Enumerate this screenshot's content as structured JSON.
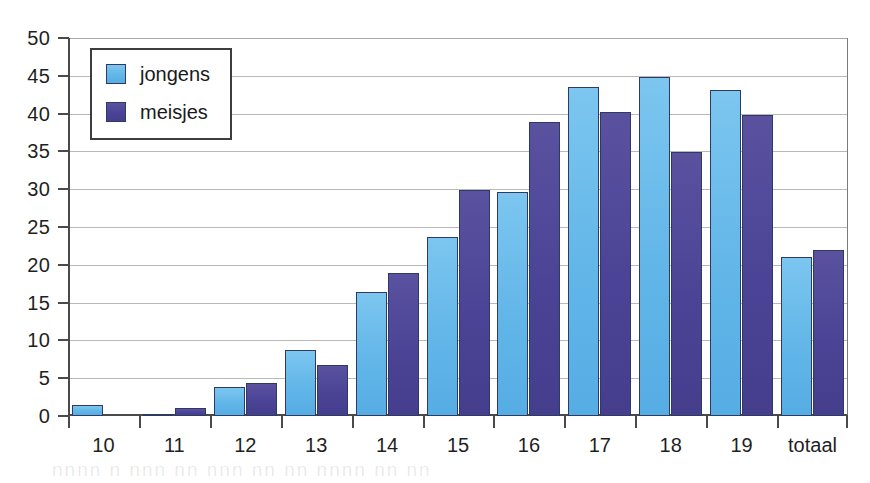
{
  "chart_data": {
    "type": "bar",
    "title": "",
    "subtitle": "",
    "xlabel": "",
    "ylabel": "",
    "categories": [
      "10",
      "11",
      "12",
      "13",
      "14",
      "15",
      "16",
      "17",
      "18",
      "19",
      "totaal"
    ],
    "series": [
      {
        "name": "jongens",
        "color": "#62b6e8",
        "values": [
          1.5,
          0.2,
          3.8,
          8.7,
          16.4,
          23.7,
          29.6,
          43.5,
          44.8,
          43.1,
          21.0
        ]
      },
      {
        "name": "meisjes",
        "color": "#4b4496",
        "values": [
          0,
          1.1,
          4.3,
          6.8,
          18.9,
          29.9,
          38.9,
          40.2,
          34.9,
          39.8,
          22.0
        ]
      }
    ],
    "ylim": [
      0,
      50
    ],
    "ytick_values": [
      0,
      5,
      10,
      15,
      20,
      25,
      30,
      35,
      40,
      45,
      50
    ],
    "ytick_labels": [
      "0",
      "5",
      "10",
      "15",
      "20",
      "25",
      "30",
      "35",
      "40",
      "45",
      "50"
    ],
    "grid": true,
    "grid_axis": "y",
    "legend_position": "upper left",
    "legend_entries": [
      "jongens",
      "meisjes"
    ],
    "annotations": []
  },
  "legend": {
    "items": [
      {
        "label": "jongens",
        "swatch": "legend-swatch-jongens"
      },
      {
        "label": "meisjes",
        "swatch": "legend-swatch-meisjes"
      }
    ]
  },
  "caption": {
    "faint_text": "nnnn   n  nnn   nn nnn    nn     nn  nnnn     nn   nn"
  },
  "colors": {
    "jongens": "#62b6e8",
    "meisjes": "#4b4496",
    "bar_outline": "#2f3a63",
    "axis": "#4a4a4a",
    "gridline": "#b9b9b9",
    "background": "#ffffff",
    "text": "#1f1f1f"
  }
}
